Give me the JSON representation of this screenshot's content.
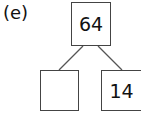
{
  "label": "(e)",
  "tree": {
    "root": {
      "value": "64"
    },
    "left": {
      "value": ""
    },
    "right": {
      "value": "14"
    }
  }
}
